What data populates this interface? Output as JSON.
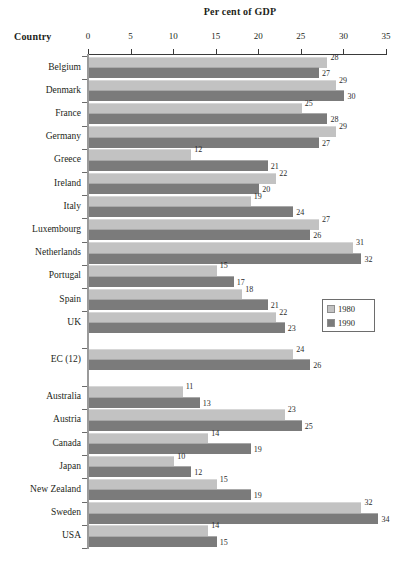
{
  "chart_data": {
    "type": "bar",
    "orientation": "horizontal",
    "title": "Per cent of GDP",
    "xlabel": "Per cent of GDP",
    "ylabel": "Country",
    "xlim": [
      0,
      35
    ],
    "xticks": [
      0,
      5,
      10,
      15,
      20,
      25,
      30,
      35
    ],
    "grid": false,
    "legend_position": "middle-right",
    "legend": [
      "1980",
      "1990"
    ],
    "series": [
      {
        "name": "1980",
        "color": "#c2c2c2",
        "values": [
          28,
          29,
          25,
          29,
          12,
          22,
          19,
          27,
          31,
          15,
          18,
          22,
          24,
          11,
          23,
          14,
          10,
          15,
          32,
          14
        ]
      },
      {
        "name": "1990",
        "color": "#7b7b7b",
        "values": [
          27,
          30,
          28,
          27,
          21,
          20,
          24,
          26,
          32,
          17,
          21,
          23,
          26,
          13,
          25,
          19,
          12,
          19,
          34,
          15
        ]
      }
    ],
    "categories": [
      "Belgium",
      "Denmark",
      "France",
      "Germany",
      "Greece",
      "Ireland",
      "Italy",
      "Luxembourg",
      "Netherlands",
      "Portugal",
      "Spain",
      "UK",
      "EC (12)",
      "Australia",
      "Austria",
      "Canada",
      "Japan",
      "New Zealand",
      "Sweden",
      "USA"
    ],
    "rows": [
      {
        "label": "Belgium",
        "v1980": 28,
        "v1990": 27,
        "spacer_before": false
      },
      {
        "label": "Denmark",
        "v1980": 29,
        "v1990": 30,
        "spacer_before": false
      },
      {
        "label": "France",
        "v1980": 25,
        "v1990": 28,
        "spacer_before": false
      },
      {
        "label": "Germany",
        "v1980": 29,
        "v1990": 27,
        "spacer_before": false
      },
      {
        "label": "Greece",
        "v1980": 12,
        "v1990": 21,
        "spacer_before": false
      },
      {
        "label": "Ireland",
        "v1980": 22,
        "v1990": 20,
        "spacer_before": false
      },
      {
        "label": "Italy",
        "v1980": 19,
        "v1990": 24,
        "spacer_before": false
      },
      {
        "label": "Luxembourg",
        "v1980": 27,
        "v1990": 26,
        "spacer_before": false
      },
      {
        "label": "Netherlands",
        "v1980": 31,
        "v1990": 32,
        "spacer_before": false
      },
      {
        "label": "Portugal",
        "v1980": 15,
        "v1990": 17,
        "spacer_before": false
      },
      {
        "label": "Spain",
        "v1980": 18,
        "v1990": 21,
        "spacer_before": false
      },
      {
        "label": "UK",
        "v1980": 22,
        "v1990": 23,
        "spacer_before": false
      },
      {
        "label": "EC (12)",
        "v1980": 24,
        "v1990": 26,
        "spacer_before": true
      },
      {
        "label": "Australia",
        "v1980": 11,
        "v1990": 13,
        "spacer_before": true
      },
      {
        "label": "Austria",
        "v1980": 23,
        "v1990": 25,
        "spacer_before": false
      },
      {
        "label": "Canada",
        "v1980": 14,
        "v1990": 19,
        "spacer_before": false
      },
      {
        "label": "Japan",
        "v1980": 10,
        "v1990": 12,
        "spacer_before": false
      },
      {
        "label": "New Zealand",
        "v1980": 15,
        "v1990": 19,
        "spacer_before": false
      },
      {
        "label": "Sweden",
        "v1980": 32,
        "v1990": 34,
        "spacer_before": false
      },
      {
        "label": "USA",
        "v1980": 14,
        "v1990": 15,
        "spacer_before": false
      }
    ]
  }
}
